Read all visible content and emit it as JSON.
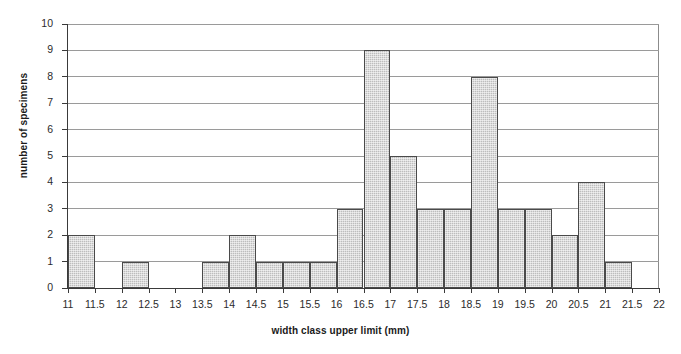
{
  "chart_data": {
    "type": "bar",
    "title": "",
    "xlabel": "width class upper limit (mm)",
    "ylabel": "number of specimens",
    "xlim": [
      11,
      22
    ],
    "ylim": [
      0,
      10
    ],
    "grid": true,
    "legend": "none",
    "bin_width": 0.5,
    "x_tick_labels": [
      "11",
      "11.5",
      "12",
      "12.5",
      "13",
      "13.5",
      "14",
      "14.5",
      "15",
      "15.5",
      "16",
      "16.5",
      "17",
      "17.5",
      "18",
      "18.5",
      "19",
      "19.5",
      "20",
      "20.5",
      "21",
      "21.5",
      "22"
    ],
    "y_tick_labels": [
      "0",
      "1",
      "2",
      "3",
      "4",
      "5",
      "6",
      "7",
      "8",
      "9",
      "10"
    ],
    "categories": [
      "11.5",
      "12",
      "12.5",
      "13",
      "13.5",
      "14",
      "14.5",
      "15",
      "15.5",
      "16",
      "16.5",
      "17",
      "17.5",
      "18",
      "18.5",
      "19",
      "19.5",
      "20",
      "20.5",
      "21",
      "21.5",
      "22"
    ],
    "values": [
      2,
      0,
      1,
      0,
      0,
      1,
      2,
      1,
      1,
      1,
      3,
      9,
      5,
      3,
      3,
      8,
      3,
      3,
      2,
      4,
      1,
      0
    ],
    "bars": [
      {
        "lower": 11,
        "upper": 11.5,
        "value": 2
      },
      {
        "lower": 11.5,
        "upper": 12,
        "value": 0
      },
      {
        "lower": 12,
        "upper": 12.5,
        "value": 1
      },
      {
        "lower": 12.5,
        "upper": 13,
        "value": 0
      },
      {
        "lower": 13,
        "upper": 13.5,
        "value": 0
      },
      {
        "lower": 13.5,
        "upper": 14,
        "value": 1
      },
      {
        "lower": 14,
        "upper": 14.5,
        "value": 2
      },
      {
        "lower": 14.5,
        "upper": 15,
        "value": 1
      },
      {
        "lower": 15,
        "upper": 15.5,
        "value": 1
      },
      {
        "lower": 15.5,
        "upper": 16,
        "value": 1
      },
      {
        "lower": 16,
        "upper": 16.5,
        "value": 3
      },
      {
        "lower": 16.5,
        "upper": 17,
        "value": 9
      },
      {
        "lower": 17,
        "upper": 17.5,
        "value": 5
      },
      {
        "lower": 17.5,
        "upper": 18,
        "value": 3
      },
      {
        "lower": 18,
        "upper": 18.5,
        "value": 3
      },
      {
        "lower": 18.5,
        "upper": 19,
        "value": 8
      },
      {
        "lower": 19,
        "upper": 19.5,
        "value": 3
      },
      {
        "lower": 19.5,
        "upper": 20,
        "value": 3
      },
      {
        "lower": 20,
        "upper": 20.5,
        "value": 2
      },
      {
        "lower": 20.5,
        "upper": 21,
        "value": 4
      },
      {
        "lower": 21,
        "upper": 21.5,
        "value": 1
      },
      {
        "lower": 21.5,
        "upper": 22,
        "value": 0
      }
    ],
    "colors": {
      "bar_fill": "#bdbdbd",
      "bar_border": "#4a4a4a",
      "grid": "#9a9a9a",
      "axis": "#3a3a3a",
      "text": "#1a1a1a",
      "background": "#ffffff"
    }
  }
}
